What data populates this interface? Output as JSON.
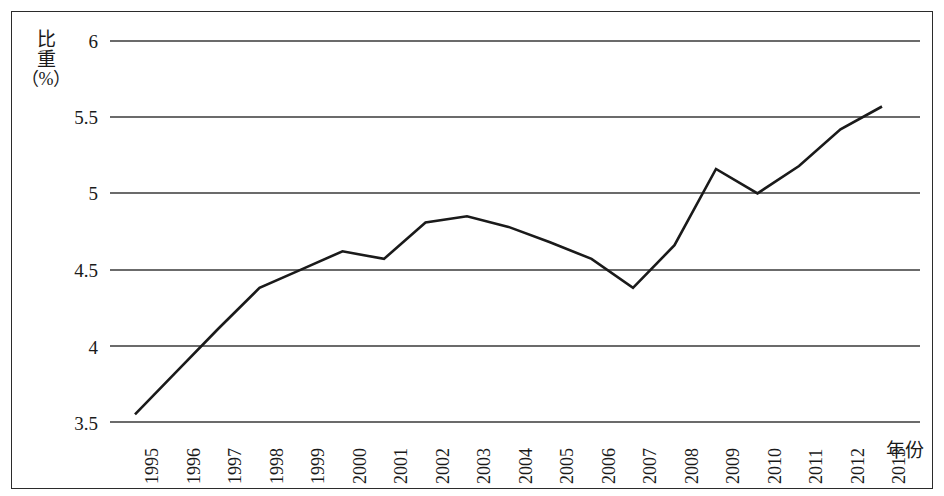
{
  "chart_data": {
    "type": "line",
    "title": "",
    "xlabel": "年份",
    "ylabel": "比重（%）",
    "ylabel_parts": [
      "比",
      "重",
      "（%）"
    ],
    "grid": true,
    "legend": "none",
    "ylim": [
      3.5,
      6
    ],
    "yticks": [
      "3.5",
      "4",
      "4.5",
      "5",
      "5.5",
      "6"
    ],
    "ytick_values": [
      3.5,
      4,
      4.5,
      5,
      5.5,
      6
    ],
    "categories": [
      "1995",
      "1996",
      "1997",
      "1998",
      "1999",
      "2000",
      "2001",
      "2002",
      "2003",
      "2004",
      "2005",
      "2006",
      "2007",
      "2008",
      "2009",
      "2010",
      "2011",
      "2012",
      "2013"
    ],
    "values": [
      3.55,
      3.83,
      4.11,
      4.38,
      4.5,
      4.62,
      4.57,
      4.81,
      4.85,
      4.78,
      4.68,
      4.57,
      4.38,
      4.66,
      5.16,
      5.0,
      5.18,
      5.42,
      5.57
    ],
    "series": [
      {
        "name": "比重",
        "values": [
          3.55,
          3.83,
          4.11,
          4.38,
          4.5,
          4.62,
          4.57,
          4.81,
          4.85,
          4.78,
          4.68,
          4.57,
          4.38,
          4.66,
          5.16,
          5.0,
          5.18,
          5.42,
          5.57
        ]
      }
    ],
    "line_color": "#1a1a1a",
    "grid_color": "#3a3a3a",
    "frame_color": "#2b2b2b"
  }
}
